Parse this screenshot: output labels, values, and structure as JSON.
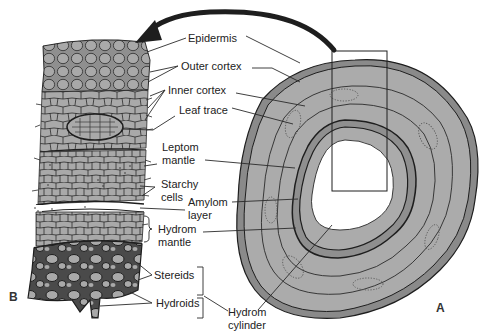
{
  "figure": {
    "panels": [
      {
        "id": "B",
        "letter": "B",
        "description": "Magnified longitudinal section of stem tissue layers"
      },
      {
        "id": "A",
        "letter": "A",
        "description": "Transverse cross-section of stem"
      }
    ],
    "labels": {
      "epidermis": "Epidermis",
      "outer_cortex": "Outer cortex",
      "inner_cortex": "Inner cortex",
      "leaf_trace": "Leaf trace",
      "leptom_mantle": "Leptom\nmantle",
      "starchy_cells": "Starchy\ncells",
      "amylom_layer": "Amylom\nlayer",
      "hydrom_mantle": "Hydrom\nmantle",
      "stereids": "Stereids",
      "hydroids": "Hydroids",
      "hydrom_cylinder": "Hydrom\ncylinder"
    },
    "colors": {
      "tissue_fill": "#a9a9a9",
      "epidermis_band": "#8a8a8a",
      "outline": "#2a2a2a",
      "arrow": "#1e1e1e",
      "background": "#ffffff"
    }
  }
}
